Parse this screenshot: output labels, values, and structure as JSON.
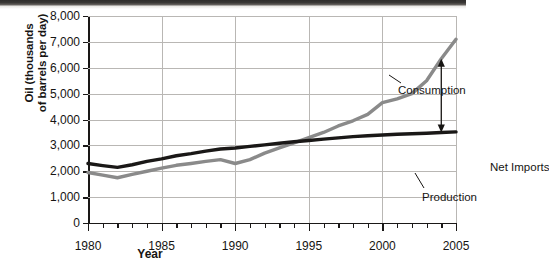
{
  "chart_data": {
    "type": "line",
    "title": "",
    "xlabel": "Year",
    "ylabel": "Oil (thousands of barrels per day)",
    "ylabel_line1": "Oil (thousands",
    "ylabel_line2": "of barrels per day)",
    "xlim": [
      1980,
      2005
    ],
    "ylim": [
      0,
      8000
    ],
    "grid": true,
    "legend_position": "inline-annotations",
    "y_ticks": [
      0,
      1000,
      2000,
      3000,
      4000,
      5000,
      6000,
      7000,
      8000
    ],
    "y_tick_labels": [
      "0",
      "1,000",
      "2,000",
      "3,000",
      "4,000",
      "5,000",
      "6,000",
      "7,000",
      "8,000"
    ],
    "x_ticks": [
      1980,
      1985,
      1990,
      1995,
      2000,
      2005
    ],
    "x_tick_labels": [
      "1980",
      "1985",
      "1990",
      "1995",
      "2000",
      "2005"
    ],
    "x_minor_tick_step": 1,
    "x": [
      1980,
      1981,
      1982,
      1983,
      1984,
      1985,
      1986,
      1987,
      1988,
      1989,
      1990,
      1991,
      1992,
      1993,
      1994,
      1995,
      1996,
      1997,
      1998,
      1999,
      2000,
      2001,
      2002,
      2003,
      2004,
      2005
    ],
    "series": [
      {
        "name": "Consumption",
        "color": "#8a8a8a",
        "values": [
          1950,
          1850,
          1750,
          1880,
          2000,
          2120,
          2230,
          2300,
          2380,
          2450,
          2300,
          2450,
          2700,
          2900,
          3100,
          3300,
          3500,
          3750,
          3950,
          4200,
          4650,
          4800,
          5000,
          5500,
          6350,
          7100
        ]
      },
      {
        "name": "Production",
        "color": "#1a1817",
        "values": [
          2300,
          2220,
          2150,
          2250,
          2380,
          2480,
          2600,
          2680,
          2780,
          2860,
          2900,
          2960,
          3020,
          3080,
          3140,
          3190,
          3240,
          3290,
          3340,
          3370,
          3400,
          3430,
          3450,
          3470,
          3500,
          3520
        ]
      }
    ],
    "annotations": [
      {
        "name": "Consumption",
        "label": "Consumption"
      },
      {
        "name": "Net Imports",
        "label": "Net Imports"
      },
      {
        "name": "Production",
        "label": "Production"
      }
    ],
    "net_imports_arrow": {
      "at_year": 2004,
      "top_value": 6350,
      "bottom_value": 3500,
      "style": "double-headed vertical arrow"
    }
  },
  "axes": {
    "y_title_line1": "Oil (thousands",
    "y_title_line2": "of barrels per day)",
    "x_title": "Year"
  },
  "labels": {
    "consumption": "Consumption",
    "net_imports": "Net Imports",
    "production": "Production"
  }
}
